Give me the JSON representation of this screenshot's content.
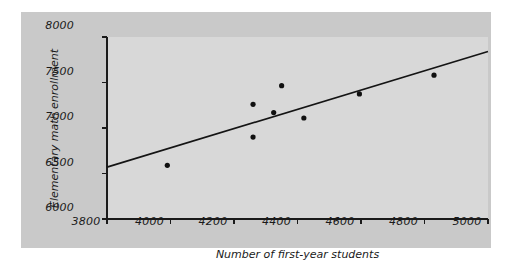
{
  "chart_data": {
    "type": "scatter",
    "title": "",
    "xlabel": "Number of first-year students",
    "ylabel": "Elementary math enrollment",
    "xlim": [
      3800,
      5000
    ],
    "ylim": [
      6000,
      8000
    ],
    "xticks": [
      3800,
      4000,
      4200,
      4400,
      4600,
      4800,
      5000
    ],
    "yticks": [
      6000,
      6500,
      7000,
      7500,
      8000
    ],
    "xtick_labels": [
      "3800",
      "4000",
      "4200",
      "4400",
      "4600",
      "4800",
      "5000"
    ],
    "ytick_labels": [
      "6000",
      "6500",
      "7000",
      "7500",
      "8000"
    ],
    "grid": false,
    "legend": "none",
    "points": [
      {
        "x": 3990,
        "y": 6590
      },
      {
        "x": 4260,
        "y": 6900
      },
      {
        "x": 4260,
        "y": 7260
      },
      {
        "x": 4325,
        "y": 7170
      },
      {
        "x": 4350,
        "y": 7465
      },
      {
        "x": 4420,
        "y": 7110
      },
      {
        "x": 4595,
        "y": 7375
      },
      {
        "x": 4830,
        "y": 7580
      }
    ],
    "trend_line": {
      "name": "least-squares regression line",
      "x": [
        3800,
        5000
      ],
      "y": [
        6570,
        7840
      ]
    },
    "marker_color": "#101010",
    "line_color": "#141414",
    "plot_background": "#d8d8d8",
    "figure_background": "#c9c9c9",
    "page_background": "#ffffff"
  }
}
